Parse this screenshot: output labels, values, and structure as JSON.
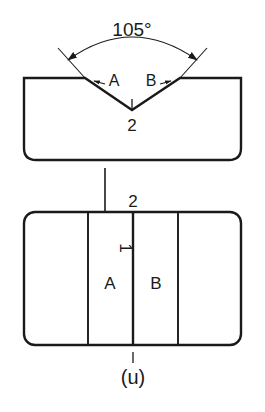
{
  "figure": {
    "caption": "(u)",
    "background_color": "#ffffff",
    "line_color": "#1a1a1a",
    "text_color": "#1a1a1a"
  },
  "upper_view": {
    "name": "V-groove cross-section",
    "angle_label": "105°",
    "bevel_left_label": "A",
    "bevel_right_label": "B",
    "root_label": "2"
  },
  "lower_view": {
    "name": "plan view of weld passes",
    "top_label": "2",
    "rotated_label": "1",
    "zone_left_label": "A",
    "zone_right_label": "B"
  },
  "projection": {
    "arrow_name": "projection-arrow"
  }
}
